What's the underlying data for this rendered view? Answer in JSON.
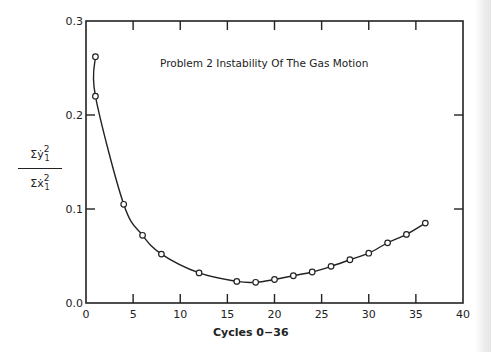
{
  "chart_data": {
    "type": "line",
    "title": "Problem 2  Instability Of The Gas Motion",
    "xlabel": "Cycles 0−36",
    "ylabel": "Σẏ₁² / Σẋ₁²",
    "ylabel_parts": {
      "numerator": "Σẏ",
      "denominator": "Σẋ",
      "sup": "2",
      "sub": "1"
    },
    "xlim": [
      0,
      40
    ],
    "ylim": [
      0.0,
      0.3
    ],
    "xticks": [
      0,
      5,
      10,
      15,
      20,
      25,
      30,
      35,
      40
    ],
    "xtick_labels": [
      "0",
      "5",
      "10",
      "15",
      "20",
      "25",
      "30",
      "35",
      "40"
    ],
    "yticks": [
      0.0,
      0.1,
      0.2,
      0.3
    ],
    "ytick_labels": [
      "0.0",
      "0.1",
      "0.2",
      "0.3"
    ],
    "grid": false,
    "legend": null,
    "marker": "open-circle",
    "series": [
      {
        "name": "Instability ratio",
        "x": [
          1,
          1,
          4,
          6,
          8,
          12,
          16,
          18,
          20,
          22,
          24,
          26,
          28,
          30,
          32,
          34,
          36
        ],
        "y": [
          0.262,
          0.22,
          0.105,
          0.072,
          0.052,
          0.032,
          0.023,
          0.022,
          0.025,
          0.029,
          0.033,
          0.039,
          0.046,
          0.053,
          0.064,
          0.073,
          0.085
        ]
      }
    ]
  },
  "style": {
    "ink": "#222222",
    "background": "#ffffff"
  }
}
